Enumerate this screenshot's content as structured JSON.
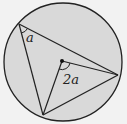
{
  "diagram": {
    "title": "",
    "labels": {
      "inscribed_angle": "a",
      "central_angle": "2a"
    },
    "colors": {
      "circle_fill": "#d9d9d9",
      "stroke": "#222222",
      "background": "#f2f2f2"
    },
    "points": {
      "center": [
        62,
        61
      ],
      "A": [
        19,
        24
      ],
      "B": [
        118,
        75
      ],
      "C": [
        43,
        115
      ]
    }
  }
}
